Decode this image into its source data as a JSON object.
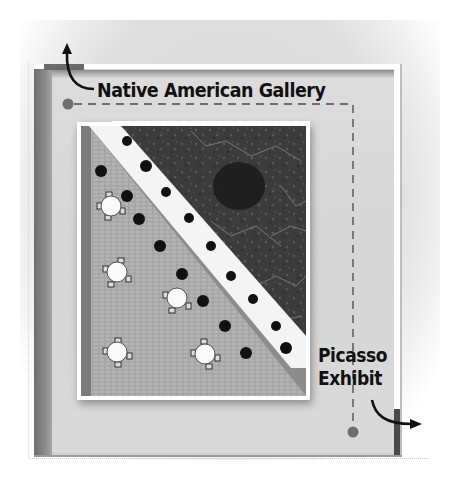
{
  "diagram": {
    "type": "floor-plan",
    "labels": {
      "entrance": "Native American Gallery",
      "exit_line1": "Picasso",
      "exit_line2": "Exhibit"
    },
    "path": {
      "style": "dashed",
      "start_marker": "dot",
      "end_marker": "dot",
      "color": "#6e6e6e"
    },
    "doorways": [
      {
        "name": "top-left-doorway",
        "leads_to": "Native American Gallery",
        "arrow": "up"
      },
      {
        "name": "bottom-right-doorway",
        "leads_to": "Picasso Exhibit",
        "arrow": "right"
      }
    ],
    "courtyard": {
      "tables": 5,
      "shrubs": 9,
      "sections": [
        "paved seating area",
        "planted garden",
        "diagonal walkway"
      ]
    },
    "colors": {
      "floor": "#d8d8d8",
      "wall_dark": "#6e6e6e",
      "wall_white": "#ffffff",
      "text": "#111111",
      "garden": "#3a3a3a",
      "paving": "#a9a9a9"
    }
  }
}
